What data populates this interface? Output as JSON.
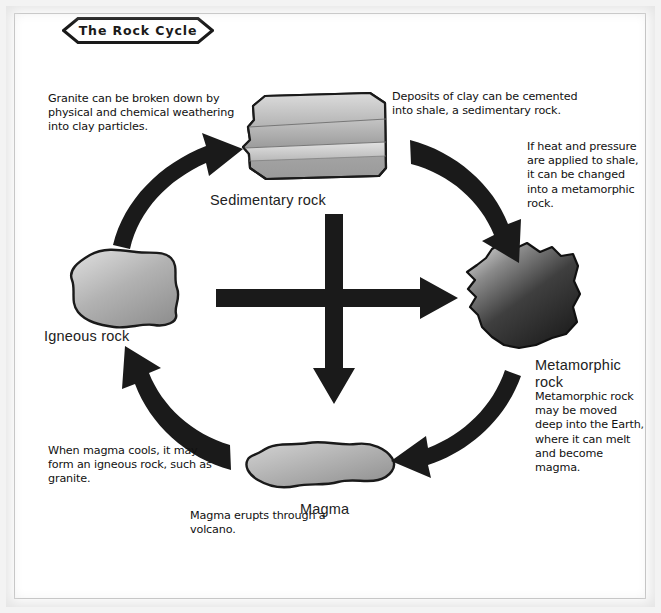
{
  "title": "The Rock Cycle",
  "notes": {
    "granite": "Granite can be broken down by physical and chemical weathering into clay particles.",
    "clay": "Deposits of clay can be cemented into shale, a sedimentary rock.",
    "heat_pressure": "If heat and pressure are applied to shale, it can be changed into a metamorphic rock.",
    "metamorphic_body": "Metamorphic rock may be moved deep into the Earth, where it can melt and become magma.",
    "magma_cools": "When magma cools, it may form an igneous rock, such as granite.",
    "magma_erupts": "Magma erupts through a volcano."
  },
  "labels": {
    "sedimentary": "Sedimentary rock",
    "igneous": "Igneous rock",
    "metamorphic": "Metamorphic rock",
    "magma": "Magma"
  },
  "colors": {
    "ink": "#111111",
    "arrow": "#1a1a1a",
    "rock_light": "#d8d8d8",
    "rock_mid": "#9a9a9a",
    "rock_dark": "#3b3b3b",
    "page": "#ffffff",
    "frame": "#bdbdbd"
  },
  "diagram": {
    "type": "cycle-diagram",
    "nodes": [
      {
        "id": "sedimentary",
        "label": "Sedimentary rock",
        "position": "top-center"
      },
      {
        "id": "metamorphic",
        "label": "Metamorphic rock",
        "position": "right"
      },
      {
        "id": "magma",
        "label": "Magma",
        "position": "bottom-center"
      },
      {
        "id": "igneous",
        "label": "Igneous rock",
        "position": "left"
      }
    ],
    "edges": [
      {
        "from": "igneous",
        "to": "sedimentary",
        "style": "curved-arrow",
        "note": "granite"
      },
      {
        "from": "sedimentary",
        "to": "metamorphic",
        "style": "curved-arrow",
        "note": "heat_pressure"
      },
      {
        "from": "metamorphic",
        "to": "magma",
        "style": "curved-arrow",
        "note": "metamorphic_body"
      },
      {
        "from": "magma",
        "to": "igneous",
        "style": "curved-arrow",
        "note": "magma_cools"
      },
      {
        "from": "center",
        "to": "metamorphic",
        "style": "straight-arrow-right"
      },
      {
        "from": "center",
        "to": "magma",
        "style": "straight-arrow-down"
      }
    ]
  }
}
